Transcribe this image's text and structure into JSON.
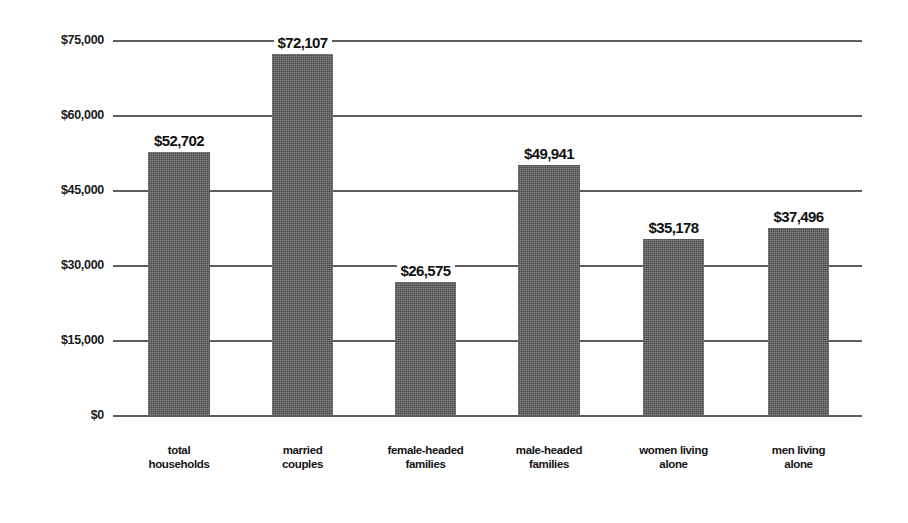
{
  "chart_data": {
    "type": "bar",
    "title": "",
    "subtitle": "",
    "xlabel": "",
    "ylabel": "",
    "categories": [
      "total households",
      "married couples",
      "female-headed families",
      "male-headed families",
      "women living alone",
      "men living alone"
    ],
    "category_lines": [
      [
        "total",
        "households"
      ],
      [
        "married",
        "couples"
      ],
      [
        "female-headed",
        "families"
      ],
      [
        "male-headed",
        "families"
      ],
      [
        "women living",
        "alone"
      ],
      [
        "men living",
        "alone"
      ]
    ],
    "values": [
      52702,
      72107,
      26575,
      49941,
      35178,
      37496
    ],
    "value_labels": [
      "$52,702",
      "$72,107",
      "$26,575",
      "$49,941",
      "$35,178",
      "$37,496"
    ],
    "ylim": [
      0,
      75000
    ],
    "ytick_values": [
      75000,
      60000,
      45000,
      30000,
      15000,
      0
    ],
    "ytick_labels": [
      "$75,000",
      "$60,000",
      "$45,000",
      "$30,000",
      "$15,000",
      "$0"
    ],
    "grid": true,
    "legend": false,
    "legend_position": "none",
    "bar_color": "#5c5c5c",
    "gridline_color": "#5e5e5e",
    "background_color": "#ffffff",
    "text_color": "#111111"
  }
}
